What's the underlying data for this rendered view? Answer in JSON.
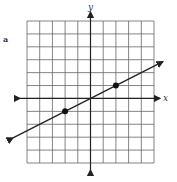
{
  "chart_data": {
    "type": "line",
    "title": "",
    "xlabel": "x",
    "ylabel": "y",
    "xlim": [
      -5,
      5
    ],
    "ylim": [
      -5,
      6
    ],
    "grid": true,
    "grid_step": 1,
    "series": [
      {
        "name": "line",
        "equation": "y = 0.5x",
        "slope": 0.5,
        "intercept": 0,
        "points": [
          {
            "x": -2,
            "y": -1
          },
          {
            "x": 2,
            "y": 1
          }
        ],
        "arrows_both_ends": true
      }
    ]
  },
  "labels": {
    "x_axis": "x",
    "y_axis": "y",
    "marker": "a"
  },
  "colors": {
    "grid": "#555555",
    "axis": "#222222",
    "line": "#222222",
    "point": "#111111"
  }
}
